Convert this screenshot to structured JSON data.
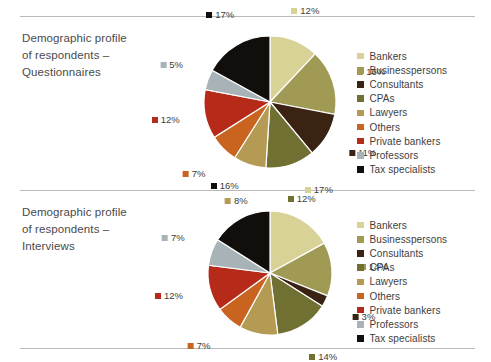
{
  "page": {
    "background": "#ffffff",
    "rule_color": "#b9b9b9"
  },
  "palette": {
    "Bankers": "#d8d296",
    "Businesspersons": "#a09a54",
    "Consultants": "#3b2314",
    "CPAs": "#6f7032",
    "Lawyers": "#b59a54",
    "Others": "#c8641f",
    "Private bankers": "#b52a18",
    "Professors": "#a8b3b8",
    "Tax specialists": "#120e0c"
  },
  "legend_items": [
    {
      "label": "Bankers",
      "color": "#d8d296"
    },
    {
      "label": "Businesspersons",
      "color": "#a09a54"
    },
    {
      "label": "Consultants",
      "color": "#3b2314"
    },
    {
      "label": "CPAs",
      "color": "#6f7032"
    },
    {
      "label": "Lawyers",
      "color": "#b59a54"
    },
    {
      "label": "Others",
      "color": "#c8641f"
    },
    {
      "label": "Private bankers",
      "color": "#b52a18"
    },
    {
      "label": "Professors",
      "color": "#a8b3b8"
    },
    {
      "label": "Tax specialists",
      "color": "#120e0c"
    }
  ],
  "charts": [
    {
      "title": "Demographic profile\nof respondents –\nQuestionnaires",
      "title_lines": [
        "Demographic profile",
        "of respondents –",
        "Questionnaires"
      ],
      "labels": [
        "12%",
        "16%",
        "11%",
        "12%",
        "8%",
        "7%",
        "12%",
        "5%",
        "17%"
      ]
    },
    {
      "title": "Demographic profile\nof respondents –\nInterviews",
      "title_lines": [
        "Demographic profile",
        "of respondents –",
        "Interviews"
      ],
      "labels": [
        "17%",
        "14%",
        "3%",
        "14%",
        "10%",
        "7%",
        "12%",
        "7%",
        "16%"
      ]
    }
  ],
  "chart_data": [
    {
      "type": "pie",
      "title": "Demographic profile of respondents – Questionnaires",
      "xlabel": "",
      "ylabel": "",
      "legend_position": "right",
      "grid": false,
      "start_angle_deg": 0,
      "direction": "clockwise",
      "categories": [
        "Bankers",
        "Businesspersons",
        "Consultants",
        "CPAs",
        "Lawyers",
        "Others",
        "Private bankers",
        "Professors",
        "Tax specialists"
      ],
      "values": [
        12,
        16,
        11,
        12,
        8,
        7,
        12,
        5,
        17
      ],
      "value_labels": [
        "12%",
        "16%",
        "11%",
        "12%",
        "8%",
        "7%",
        "12%",
        "5%",
        "17%"
      ],
      "units": "percent",
      "colors": [
        "#d8d296",
        "#a09a54",
        "#3b2314",
        "#6f7032",
        "#b59a54",
        "#c8641f",
        "#b52a18",
        "#a8b3b8",
        "#120e0c"
      ]
    },
    {
      "type": "pie",
      "title": "Demographic profile of respondents – Interviews",
      "xlabel": "",
      "ylabel": "",
      "legend_position": "right",
      "grid": false,
      "start_angle_deg": 0,
      "direction": "clockwise",
      "categories": [
        "Bankers",
        "Businesspersons",
        "Consultants",
        "CPAs",
        "Lawyers",
        "Others",
        "Private bankers",
        "Professors",
        "Tax specialists"
      ],
      "values": [
        17,
        14,
        3,
        14,
        10,
        7,
        12,
        7,
        16
      ],
      "value_labels": [
        "17%",
        "14%",
        "3%",
        "14%",
        "10%",
        "7%",
        "12%",
        "7%",
        "16%"
      ],
      "units": "percent",
      "colors": [
        "#d8d296",
        "#a09a54",
        "#3b2314",
        "#6f7032",
        "#b59a54",
        "#c8641f",
        "#b52a18",
        "#a8b3b8",
        "#120e0c"
      ]
    }
  ]
}
